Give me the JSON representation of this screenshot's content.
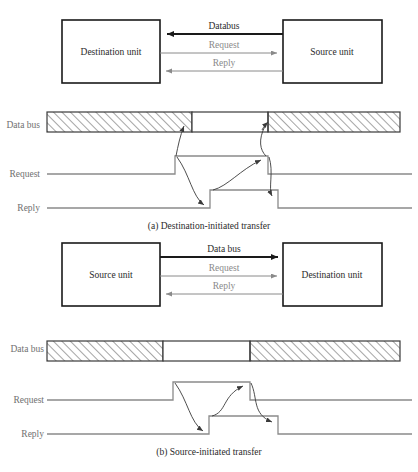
{
  "figure": {
    "sections": [
      {
        "id": "a",
        "caption": "(a) Destination-initiated transfer",
        "block_diagram": {
          "left_unit": "Destination unit",
          "right_unit": "Source unit",
          "signals": [
            {
              "label": "Databus",
              "direction": "left",
              "style": "thick-black"
            },
            {
              "label": "Request",
              "direction": "right",
              "style": "thin-gray"
            },
            {
              "label": "Reply",
              "direction": "left",
              "style": "thin-gray"
            }
          ]
        },
        "timing": {
          "bus_label": "Data bus",
          "bus_segments": [
            {
              "state": "invalid",
              "fill": "hatched"
            },
            {
              "state": "valid",
              "fill": "white"
            },
            {
              "state": "invalid",
              "fill": "hatched"
            }
          ],
          "waveforms": [
            {
              "label": "Request",
              "pulse": "high"
            },
            {
              "label": "Reply",
              "pulse": "high"
            }
          ],
          "causal_arrows": 4
        }
      },
      {
        "id": "b",
        "caption": "(b) Source-initiated transfer",
        "block_diagram": {
          "left_unit": "Source unit",
          "right_unit": "Destination unit",
          "signals": [
            {
              "label": "Data bus",
              "direction": "right",
              "style": "thick-black"
            },
            {
              "label": "Request",
              "direction": "right",
              "style": "thin-gray"
            },
            {
              "label": "Reply",
              "direction": "left",
              "style": "thin-gray"
            }
          ]
        },
        "timing": {
          "bus_label": "Data bus",
          "bus_segments": [
            {
              "state": "invalid",
              "fill": "hatched"
            },
            {
              "state": "valid",
              "fill": "white"
            },
            {
              "state": "invalid",
              "fill": "hatched"
            }
          ],
          "waveforms": [
            {
              "label": "Request",
              "pulse": "high"
            },
            {
              "label": "Reply",
              "pulse": "high"
            }
          ],
          "causal_arrows": 2
        }
      }
    ],
    "colors": {
      "black": "#1a1a1a",
      "gray_signal": "#8a8a8a",
      "hatch": "#5a5a5a",
      "text_dark": "#2b2b2b",
      "text_gray": "#8a8a8a"
    }
  }
}
